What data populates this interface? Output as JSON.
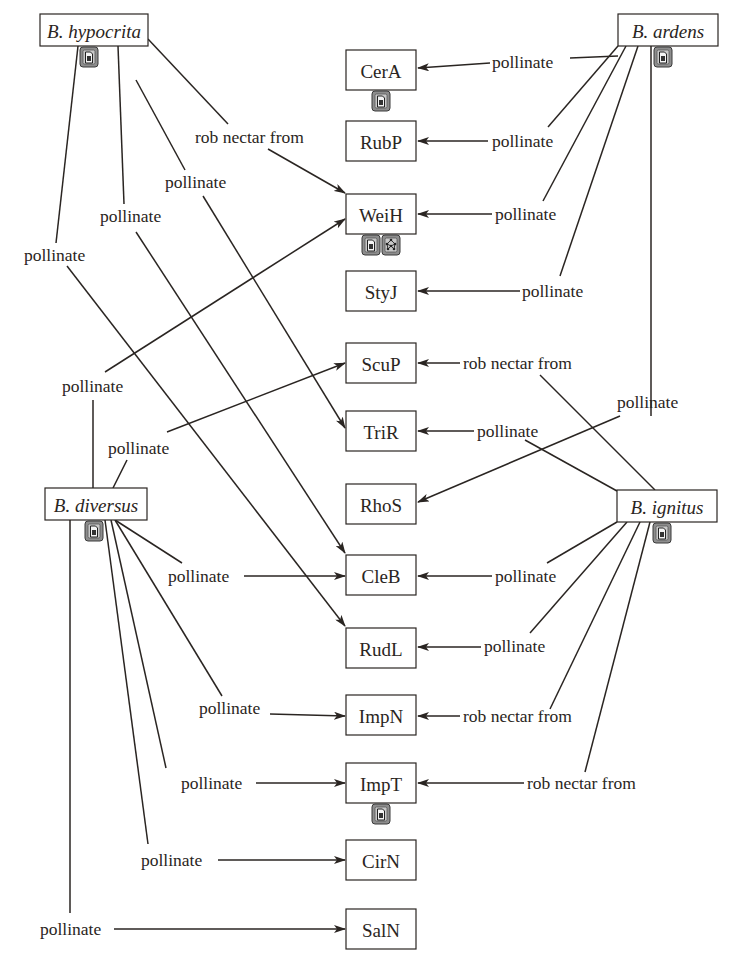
{
  "diagram": {
    "type": "bipartite-interaction-network",
    "species": [
      {
        "id": "hyp",
        "label": "B. hypocrita",
        "x": 40,
        "y": 14,
        "w": 108,
        "h": 32,
        "badges": [
          "document-icon"
        ]
      },
      {
        "id": "ard",
        "label": "B. ardens",
        "x": 618,
        "y": 14,
        "w": 100,
        "h": 32,
        "badges": [
          "document-icon"
        ]
      },
      {
        "id": "div",
        "label": "B. diversus",
        "x": 45,
        "y": 488,
        "w": 102,
        "h": 32,
        "badges": [
          "document-icon"
        ]
      },
      {
        "id": "ign",
        "label": "B. ignitus",
        "x": 617,
        "y": 490,
        "w": 100,
        "h": 32,
        "badges": [
          "document-icon"
        ]
      }
    ],
    "plants": [
      {
        "id": "CerA",
        "label": "CerA",
        "x": 346,
        "y": 50,
        "w": 70,
        "h": 40,
        "badges": [
          "document-icon"
        ]
      },
      {
        "id": "RubP",
        "label": "RubP",
        "x": 346,
        "y": 121,
        "w": 70,
        "h": 40,
        "badges": []
      },
      {
        "id": "WeiH",
        "label": "WeiH",
        "x": 346,
        "y": 194,
        "w": 70,
        "h": 40,
        "badges": [
          "document-icon",
          "network-icon"
        ]
      },
      {
        "id": "StyJ",
        "label": "StyJ",
        "x": 346,
        "y": 271,
        "w": 70,
        "h": 40,
        "badges": []
      },
      {
        "id": "ScuP",
        "label": "ScuP",
        "x": 346,
        "y": 343,
        "w": 70,
        "h": 40,
        "badges": []
      },
      {
        "id": "TriR",
        "label": "TriR",
        "x": 346,
        "y": 411,
        "w": 70,
        "h": 40,
        "badges": []
      },
      {
        "id": "RhoS",
        "label": "RhoS",
        "x": 346,
        "y": 484,
        "w": 70,
        "h": 40,
        "badges": []
      },
      {
        "id": "CleB",
        "label": "CleB",
        "x": 346,
        "y": 555,
        "w": 70,
        "h": 40,
        "badges": []
      },
      {
        "id": "RudL",
        "label": "RudL",
        "x": 346,
        "y": 628,
        "w": 70,
        "h": 40,
        "badges": []
      },
      {
        "id": "ImpN",
        "label": "ImpN",
        "x": 346,
        "y": 695,
        "w": 70,
        "h": 40,
        "badges": []
      },
      {
        "id": "ImpT",
        "label": "ImpT",
        "x": 346,
        "y": 763,
        "w": 70,
        "h": 40,
        "badges": [
          "document-icon"
        ]
      },
      {
        "id": "CirN",
        "label": "CirN",
        "x": 346,
        "y": 840,
        "w": 70,
        "h": 40,
        "badges": []
      },
      {
        "id": "SalN",
        "label": "SalN",
        "x": 346,
        "y": 909,
        "w": 70,
        "h": 40,
        "badges": []
      }
    ],
    "edges": [
      {
        "from": "B. ardens",
        "to": "CerA",
        "label": "pollinate",
        "lx": 492,
        "ly": 62,
        "path": [
          [
            618,
            56
          ],
          [
            570,
            58
          ]
        ],
        "arrow": [
          [
            490,
            63
          ],
          [
            418,
            68
          ]
        ]
      },
      {
        "from": "B. ardens",
        "to": "RubP",
        "label": "pollinate",
        "lx": 492,
        "ly": 141,
        "path": [
          [
            618,
            46
          ],
          [
            548,
            127
          ]
        ],
        "arrow": [
          [
            488,
            141
          ],
          [
            418,
            141
          ]
        ]
      },
      {
        "from": "B. ardens",
        "to": "WeiH",
        "label": "pollinate",
        "lx": 495,
        "ly": 214,
        "path": [
          [
            626,
            46
          ],
          [
            543,
            201
          ]
        ],
        "arrow": [
          [
            492,
            214
          ],
          [
            418,
            214
          ]
        ]
      },
      {
        "from": "B. ardens",
        "to": "StyJ",
        "label": "pollinate",
        "lx": 522,
        "ly": 291,
        "path": [
          [
            638,
            46
          ],
          [
            560,
            276
          ]
        ],
        "arrow": [
          [
            520,
            291
          ],
          [
            418,
            291
          ]
        ]
      },
      {
        "from": "B. ardens",
        "to": "RhoS",
        "label": "pollinate",
        "lx": 617,
        "ly": 402,
        "path": [
          [
            651,
            46
          ],
          [
            651,
            388
          ],
          [
            651,
            416
          ]
        ],
        "arrow": [
          [
            620,
            416
          ],
          [
            418,
            502
          ]
        ]
      },
      {
        "from": "B. ignitus",
        "to": "ScuP",
        "label": "rob nectar from",
        "lx": 463,
        "ly": 363,
        "path": [
          [
            655,
            490
          ],
          [
            540,
            375
          ]
        ],
        "arrow": [
          [
            460,
            363
          ],
          [
            418,
            363
          ]
        ]
      },
      {
        "from": "B. ignitus",
        "to": "TriR",
        "label": "pollinate",
        "lx": 477,
        "ly": 431,
        "path": [
          [
            617,
            491
          ],
          [
            525,
            440
          ]
        ],
        "arrow": [
          [
            474,
            431
          ],
          [
            418,
            431
          ]
        ]
      },
      {
        "from": "B. ignitus",
        "to": "CleB",
        "label": "pollinate",
        "lx": 495,
        "ly": 576,
        "path": [
          [
            617,
            522
          ],
          [
            547,
            563
          ]
        ],
        "arrow": [
          [
            492,
            576
          ],
          [
            418,
            576
          ]
        ]
      },
      {
        "from": "B. ignitus",
        "to": "RudL",
        "label": "pollinate",
        "lx": 484,
        "ly": 646,
        "path": [
          [
            627,
            522
          ],
          [
            530,
            633
          ]
        ],
        "arrow": [
          [
            481,
            647
          ],
          [
            418,
            647
          ]
        ]
      },
      {
        "from": "B. ignitus",
        "to": "ImpN",
        "label": "rob nectar from",
        "lx": 463,
        "ly": 716,
        "path": [
          [
            640,
            522
          ],
          [
            550,
            709
          ]
        ],
        "arrow": [
          [
            460,
            716
          ],
          [
            418,
            716
          ]
        ]
      },
      {
        "from": "B. ignitus",
        "to": "ImpT",
        "label": "rob nectar from",
        "lx": 527,
        "ly": 783,
        "path": [
          [
            650,
            522
          ],
          [
            585,
            772
          ]
        ],
        "arrow": [
          [
            524,
            783
          ],
          [
            418,
            783
          ]
        ]
      },
      {
        "from": "B. hypocrita",
        "to": "WeiH",
        "label": "rob nectar from",
        "lx": 195,
        "ly": 137,
        "path": [
          [
            148,
            39
          ],
          [
            228,
            124
          ]
        ],
        "arrow": [
          [
            268,
            149
          ],
          [
            345,
            193
          ]
        ]
      },
      {
        "from": "B. hypocrita",
        "to": "TriR",
        "label": "pollinate",
        "lx": 165,
        "ly": 182,
        "path": [
          [
            136,
            80
          ],
          [
            185,
            170
          ]
        ],
        "arrow": [
          [
            203,
            196
          ],
          [
            345,
            428
          ]
        ]
      },
      {
        "from": "B. hypocrita",
        "to": "CleB",
        "label": "pollinate",
        "lx": 100,
        "ly": 216,
        "path": [
          [
            118,
            46
          ],
          [
            124,
            204
          ]
        ],
        "arrow": [
          [
            136,
            232
          ],
          [
            345,
            553
          ]
        ]
      },
      {
        "from": "B. hypocrita",
        "to": "RudL",
        "label": "pollinate",
        "lx": 24,
        "ly": 255,
        "path": [
          [
            78,
            46
          ],
          [
            56,
            243
          ]
        ],
        "arrow": [
          [
            67,
            266
          ],
          [
            345,
            626
          ]
        ]
      },
      {
        "from": "B. diversus",
        "to": "WeiH",
        "label": "pollinate",
        "lx": 62,
        "ly": 386,
        "path": [
          [
            93,
            488
          ],
          [
            93,
            400
          ]
        ],
        "arrow": [
          [
            105,
            372
          ],
          [
            345,
            219
          ]
        ]
      },
      {
        "from": "B. diversus",
        "to": "ScuP",
        "label": "pollinate",
        "lx": 108,
        "ly": 448,
        "path": [
          [
            113,
            488
          ],
          [
            127,
            460
          ]
        ],
        "arrow": [
          [
            167,
            432
          ],
          [
            345,
            363
          ]
        ]
      },
      {
        "from": "B. diversus",
        "to": "CleB",
        "label": "pollinate",
        "lx": 168,
        "ly": 576,
        "path": [
          [
            115,
            520
          ],
          [
            182,
            563
          ]
        ],
        "arrow": [
          [
            244,
            576
          ],
          [
            345,
            576
          ]
        ]
      },
      {
        "from": "B. diversus",
        "to": "ImpN",
        "label": "pollinate",
        "lx": 199,
        "ly": 708,
        "path": [
          [
            115,
            520
          ],
          [
            222,
            696
          ]
        ],
        "arrow": [
          [
            270,
            714
          ],
          [
            345,
            716
          ]
        ]
      },
      {
        "from": "B. diversus",
        "to": "ImpT",
        "label": "pollinate",
        "lx": 181,
        "ly": 783,
        "path": [
          [
            111,
            520
          ],
          [
            166,
            768
          ]
        ],
        "arrow": [
          [
            256,
            783
          ],
          [
            345,
            783
          ]
        ]
      },
      {
        "from": "B. diversus",
        "to": "CirN",
        "label": "pollinate",
        "lx": 141,
        "ly": 860,
        "path": [
          [
            105,
            520
          ],
          [
            148,
            844
          ]
        ],
        "arrow": [
          [
            218,
            860
          ],
          [
            345,
            860
          ]
        ]
      },
      {
        "from": "B. diversus",
        "to": "SalN",
        "label": "pollinate",
        "lx": 40,
        "ly": 929,
        "path": [
          [
            70,
            520
          ],
          [
            70,
            913
          ]
        ],
        "arrow": [
          [
            114,
            929
          ],
          [
            345,
            929
          ]
        ]
      }
    ]
  }
}
